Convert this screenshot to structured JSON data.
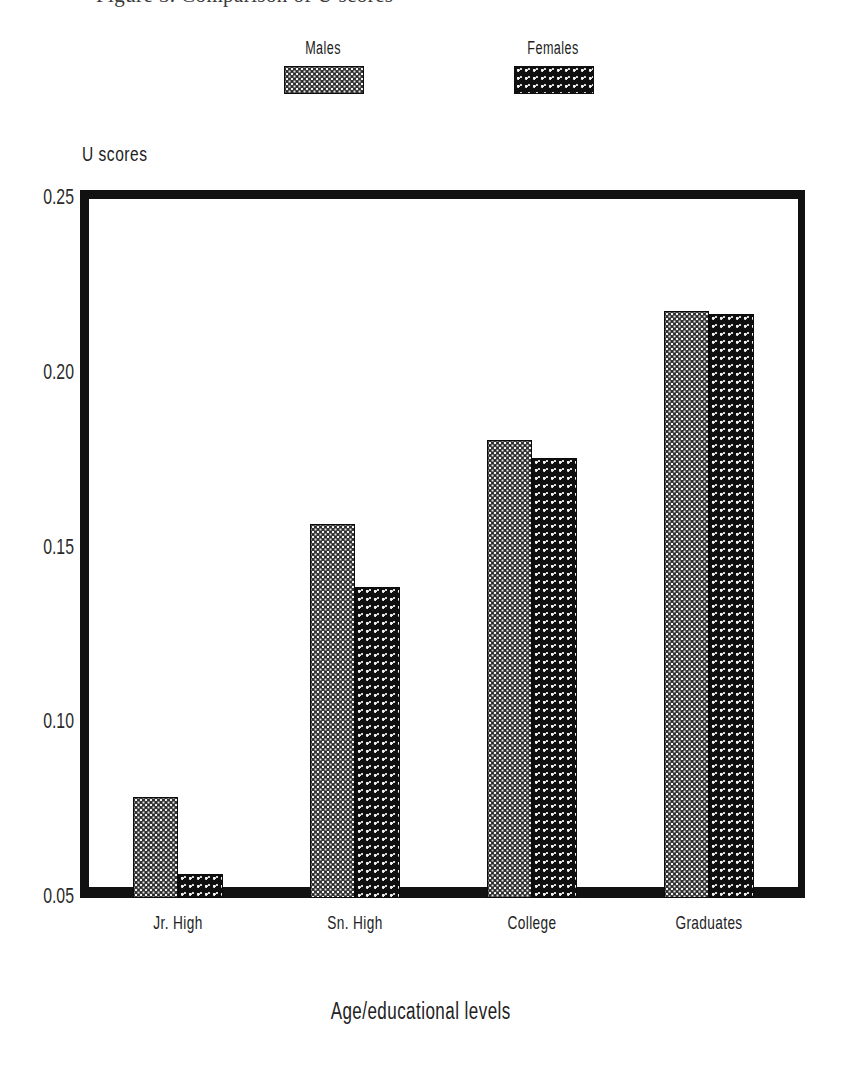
{
  "top_caption": {
    "clipped_text": "Figure 3. Comparison of U scores"
  },
  "legend": {
    "position": "above-plot",
    "entries": [
      {
        "label": "Males",
        "swatch": "dense-dot-grid-pattern",
        "color": "#2c2c2c"
      },
      {
        "label": "Females",
        "swatch": "sparse-dot-pattern",
        "color": "#0f0f0f"
      }
    ]
  },
  "axes": {
    "y_title": "U scores",
    "x_title": "Age/educational levels",
    "y_ticks": [
      "0.25",
      "0.20",
      "0.15",
      "0.10",
      "0.05"
    ],
    "x_ticks": [
      "Jr. High",
      "Sn. High",
      "College",
      "Graduates"
    ]
  },
  "chart_data": {
    "type": "bar",
    "title": "",
    "subtitle": "",
    "xlabel": "Age/educational levels",
    "ylabel": "U scores",
    "categories": [
      "Jr. High",
      "Sn. High",
      "College",
      "Graduates"
    ],
    "series": [
      {
        "name": "Males",
        "values": [
          0.079,
          0.157,
          0.181,
          0.218
        ]
      },
      {
        "name": "Females",
        "values": [
          0.057,
          0.139,
          0.176,
          0.217
        ]
      }
    ],
    "ylim": [
      0.05,
      0.25
    ],
    "ytick_values": [
      0.25,
      0.2,
      0.15,
      0.1,
      0.05
    ],
    "grid": false,
    "legend_position": "top-center",
    "bar_style": "grouped-adjacent-pairs"
  }
}
